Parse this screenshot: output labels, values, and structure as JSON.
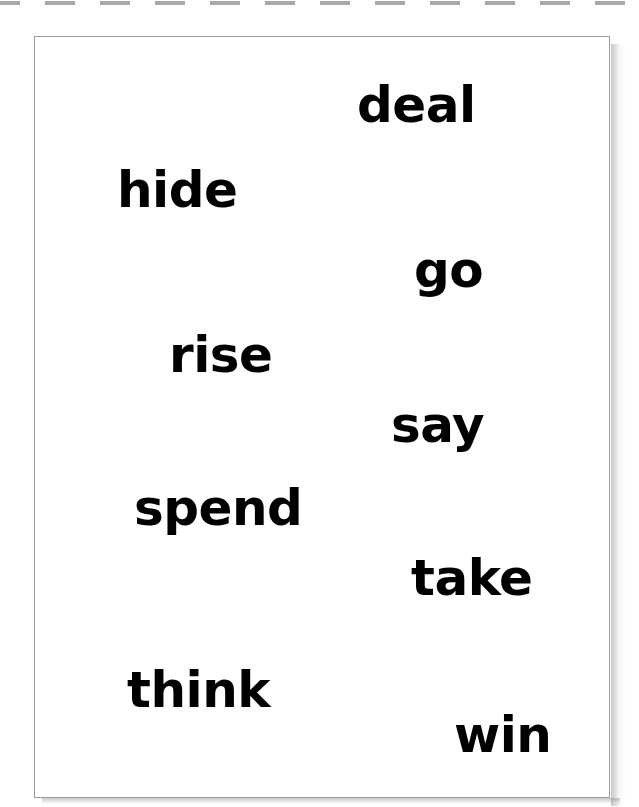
{
  "page": {
    "background_color": "#ffffff",
    "width": 639,
    "height": 807
  },
  "dashed_rule": {
    "name": "dashed-cut-line",
    "color": "#a8a8a8",
    "dash_length": 30,
    "gap_length": 25,
    "y": 1,
    "thickness": 4
  },
  "card": {
    "border_color": "#9a9a9a",
    "background_color": "#ffffff",
    "x": 34,
    "y": 36,
    "width": 576,
    "height": 762
  },
  "words": [
    {
      "text": "deal",
      "x": 357,
      "y": 80,
      "size": 50
    },
    {
      "text": "hide",
      "x": 117,
      "y": 165,
      "size": 50
    },
    {
      "text": "go",
      "x": 414,
      "y": 245,
      "size": 50
    },
    {
      "text": "rise",
      "x": 169,
      "y": 330,
      "size": 50
    },
    {
      "text": "say",
      "x": 391,
      "y": 400,
      "size": 50
    },
    {
      "text": "spend",
      "x": 134,
      "y": 483,
      "size": 50
    },
    {
      "text": "take",
      "x": 411,
      "y": 553,
      "size": 50
    },
    {
      "text": "think",
      "x": 127,
      "y": 665,
      "size": 50
    },
    {
      "text": "win",
      "x": 454,
      "y": 710,
      "size": 50
    }
  ]
}
